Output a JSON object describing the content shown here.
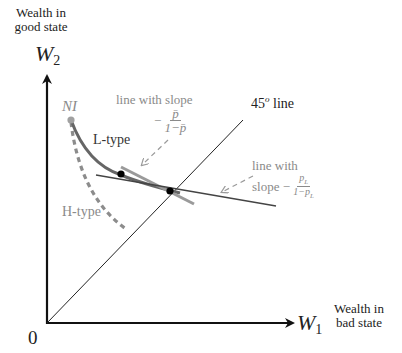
{
  "axes": {
    "y_label": "Wealth in good state",
    "y_label_line1": "Wealth in",
    "y_label_line2": "good state",
    "y_var": "W",
    "y_var_sub": "2",
    "x_label_line1": "Wealth in",
    "x_label_line2": "bad state",
    "x_var": "W",
    "x_var_sub": "1",
    "origin": "0"
  },
  "labels": {
    "ni": "NI",
    "l_type": "L-type",
    "h_type": "H-type",
    "line_45": "45",
    "line_45_sup": "o",
    "line_45_suffix": " line",
    "pbar_line_text": "line with slope",
    "pbar_minus": "−",
    "pbar_num": "p̄",
    "pbar_den": "1−p̄",
    "pl_line_text1": "line with",
    "pl_line_text2": "slope −",
    "pl_num": "p",
    "pl_num_sub": "L",
    "pl_den": "1−p",
    "pl_den_sub": "L"
  },
  "colors": {
    "axis": "#111111",
    "l_curve": "#666666",
    "h_curve": "#8c8c8c",
    "gray_line": "#9a9a9a",
    "dark_line": "#444444",
    "ni_point": "#a0a0a0",
    "dot": "#000000",
    "gray_text": "#8a8a8a"
  }
}
